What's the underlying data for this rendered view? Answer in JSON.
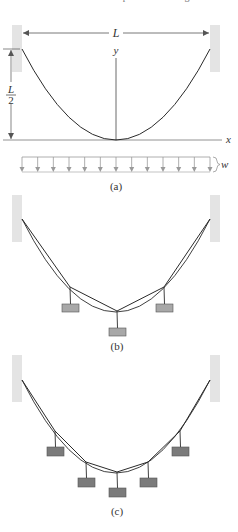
{
  "header_cut_text": "  the cable of a suspension bridge",
  "colors": {
    "line": "#2a2a2a",
    "wall": "#e4e4e4",
    "dim": "#555555",
    "load_arrow": "#9a9a9a",
    "weight_b": "#a8a8a8",
    "weight_c": "#7b7b7b",
    "weight_stroke": "#555555"
  },
  "panel_a": {
    "caption": "(a)",
    "span_label": "L",
    "sag_label_num": "L",
    "sag_label_den": "2",
    "y_axis_label": "y",
    "x_axis_label": "x",
    "load_label": "w",
    "load_arrow_count": 13,
    "walls": [
      {
        "x": 12,
        "y": 25,
        "w": 10,
        "h": 47
      },
      {
        "x": 210,
        "y": 25,
        "w": 10,
        "h": 47
      }
    ],
    "supports": [
      [
        22,
        49
      ],
      [
        210,
        49
      ]
    ],
    "vertex": [
      116,
      140
    ]
  },
  "panel_b": {
    "caption": "(b)",
    "walls": [
      {
        "x": 12,
        "y": 195,
        "w": 10,
        "h": 47
      },
      {
        "x": 210,
        "y": 195,
        "w": 10,
        "h": 47
      }
    ],
    "supports": [
      [
        22,
        219
      ],
      [
        210,
        219
      ]
    ],
    "vertex": [
      116,
      312
    ],
    "knots": [
      [
        70,
        287
      ],
      [
        117,
        311
      ],
      [
        164,
        287
      ]
    ],
    "weights": [
      {
        "x": 62,
        "y": 304,
        "w": 17,
        "h": 8
      },
      {
        "x": 109,
        "y": 328,
        "w": 17,
        "h": 8
      },
      {
        "x": 156,
        "y": 304,
        "w": 17,
        "h": 8
      }
    ]
  },
  "panel_c": {
    "caption": "(c)",
    "walls": [
      {
        "x": 12,
        "y": 355,
        "w": 10,
        "h": 47
      },
      {
        "x": 210,
        "y": 355,
        "w": 10,
        "h": 47
      }
    ],
    "supports": [
      [
        22,
        380
      ],
      [
        210,
        380
      ]
    ],
    "vertex": [
      116,
      473
    ],
    "knots": [
      [
        55,
        431
      ],
      [
        86,
        462
      ],
      [
        117,
        472
      ],
      [
        148,
        462
      ],
      [
        180,
        431
      ]
    ],
    "weights": [
      {
        "x": 47,
        "y": 447,
        "w": 17,
        "h": 9
      },
      {
        "x": 78,
        "y": 478,
        "w": 17,
        "h": 9
      },
      {
        "x": 109,
        "y": 488,
        "w": 17,
        "h": 9
      },
      {
        "x": 140,
        "y": 478,
        "w": 17,
        "h": 9
      },
      {
        "x": 172,
        "y": 447,
        "w": 17,
        "h": 9
      }
    ]
  }
}
